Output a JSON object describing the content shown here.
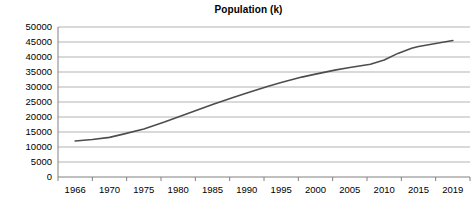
{
  "chart_data": {
    "type": "line",
    "title": "Population (k)",
    "xlabel": "",
    "ylabel": "",
    "grid": true,
    "legend": "none",
    "ylim": [
      0,
      50000
    ],
    "ytick_labels": [
      "50000",
      "45000",
      "40000",
      "35000",
      "30000",
      "25000",
      "20000",
      "15000",
      "10000",
      "5000",
      "0"
    ],
    "ytick_values": [
      50000,
      45000,
      40000,
      35000,
      30000,
      25000,
      20000,
      15000,
      10000,
      5000,
      0
    ],
    "categories": [
      "1966",
      "1970",
      "1975",
      "1980",
      "1985",
      "1990",
      "1995",
      "2000",
      "2005",
      "2010",
      "2015",
      "2019"
    ],
    "x": [
      1966,
      1970,
      1975,
      1980,
      1985,
      1990,
      1995,
      2000,
      2005,
      2010,
      2015,
      2019
    ],
    "series": [
      {
        "name": "Population (k)",
        "color": "#4d4d4d",
        "values": [
          12000,
          13200,
          16000,
          20000,
          24200,
          28000,
          31500,
          34300,
          36500,
          39000,
          43500,
          45500
        ]
      }
    ],
    "detail_points": [
      {
        "year": 1966,
        "value": 12000
      },
      {
        "year": 1968,
        "value": 12500
      },
      {
        "year": 1970,
        "value": 13200
      },
      {
        "year": 1972,
        "value": 14300
      },
      {
        "year": 1975,
        "value": 16000
      },
      {
        "year": 1978,
        "value": 18300
      },
      {
        "year": 1980,
        "value": 20000
      },
      {
        "year": 1983,
        "value": 22500
      },
      {
        "year": 1985,
        "value": 24200
      },
      {
        "year": 1988,
        "value": 26500
      },
      {
        "year": 1990,
        "value": 28000
      },
      {
        "year": 1993,
        "value": 30200
      },
      {
        "year": 1995,
        "value": 31500
      },
      {
        "year": 1998,
        "value": 33300
      },
      {
        "year": 2000,
        "value": 34300
      },
      {
        "year": 2003,
        "value": 35700
      },
      {
        "year": 2005,
        "value": 36500
      },
      {
        "year": 2008,
        "value": 37600
      },
      {
        "year": 2010,
        "value": 39000
      },
      {
        "year": 2012,
        "value": 41200
      },
      {
        "year": 2014,
        "value": 42900
      },
      {
        "year": 2015,
        "value": 43500
      },
      {
        "year": 2017,
        "value": 44500
      },
      {
        "year": 2019,
        "value": 45500
      }
    ]
  },
  "style": {
    "grid_color": "#b3b3b3",
    "axis_color": "#808080",
    "line_color": "#4d4d4d",
    "text_color": "#000000",
    "background": "#ffffff"
  }
}
